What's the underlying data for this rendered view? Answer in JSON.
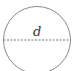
{
  "diagram": {
    "shape": "circle",
    "diameter_label": "d",
    "stroke_color": "#8a8a8a",
    "dashed_line": "horizontal diameter"
  }
}
